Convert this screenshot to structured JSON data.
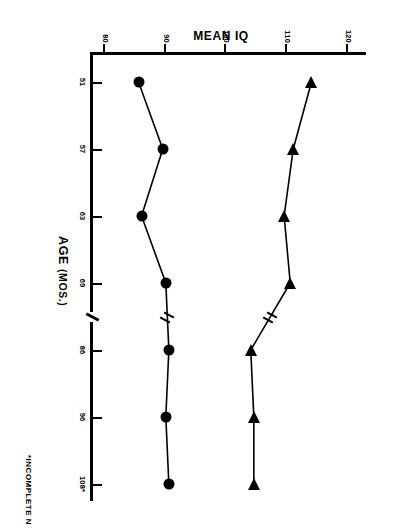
{
  "chart_data": {
    "type": "line",
    "title": "",
    "xlabel": "AGE (MOS.)",
    "ylabel": "MEAN IQ",
    "footnote": "*INCOMPLETE N",
    "x_tick_labels": [
      "51",
      "57",
      "63",
      "69",
      "86",
      "96",
      "108*"
    ],
    "x_values": [
      51,
      57,
      63,
      69,
      86,
      96,
      108
    ],
    "y_tick_labels": [
      "120",
      "110",
      "100",
      "90",
      "80"
    ],
    "y_ticks": [
      120,
      110,
      100,
      90,
      80
    ],
    "ylim": [
      78,
      122
    ],
    "grid": false,
    "legend": "none",
    "axis_break": {
      "axis": "x",
      "between": [
        69,
        86
      ]
    },
    "series": [
      {
        "name": "upper-group",
        "marker": "triangle",
        "values": [
          114,
          111,
          109.5,
          110.5,
          104,
          104.5,
          104.5
        ],
        "has_break_between": [
          69,
          86
        ]
      },
      {
        "name": "lower-group",
        "marker": "circle",
        "values": [
          85.5,
          89.5,
          86,
          90,
          90.5,
          90,
          90.5
        ],
        "has_break_between": [
          69,
          86
        ]
      }
    ]
  },
  "axes": {
    "x_title_main": "AGE",
    "x_title_unit": "(MOS.)",
    "y_title": "MEAN IQ"
  },
  "colors": {
    "ink": "#000000",
    "paper": "#ffffff"
  }
}
